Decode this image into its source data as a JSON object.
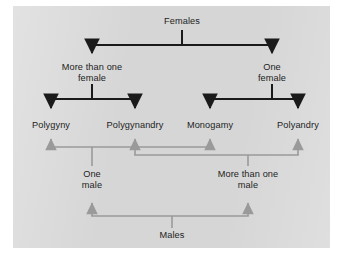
{
  "diagram": {
    "background_color": "#d6d6d6",
    "page_color": "#ffffff",
    "female_branch_color": "#1a1a1a",
    "male_branch_color": "#9a9a9a"
  },
  "female_tree": {
    "root": {
      "label": "Females",
      "x": 182,
      "y": 22
    },
    "level1": [
      {
        "label": "More than one\nfemale",
        "x": 92,
        "y": 68
      },
      {
        "label": "One\nfemale",
        "x": 272,
        "y": 68
      }
    ]
  },
  "outcomes": [
    {
      "label": "Polygyny",
      "x": 51,
      "y": 126
    },
    {
      "label": "Polygynandry",
      "x": 135,
      "y": 126
    },
    {
      "label": "Monogamy",
      "x": 210,
      "y": 126
    },
    {
      "label": "Polyandry",
      "x": 298,
      "y": 126
    }
  ],
  "male_tree": {
    "root": {
      "label": "Males",
      "x": 172,
      "y": 236
    },
    "level1": [
      {
        "label": "One\nmale",
        "x": 92,
        "y": 175
      },
      {
        "label": "More than one\nmale",
        "x": 248,
        "y": 175
      }
    ]
  },
  "icons": {
    "female_arrow": "arrow-down-icon",
    "male_arrow": "arrow-up-icon"
  }
}
